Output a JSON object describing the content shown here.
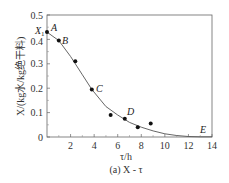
{
  "chart_data": {
    "type": "scatter",
    "title": "",
    "caption": "(a) X - τ",
    "xlabel": "τ/h",
    "ylabel": "X/(kg水/kg绝干料)",
    "xlim": [
      0,
      14
    ],
    "ylim": [
      0,
      0.5
    ],
    "xticks": [
      2,
      4,
      6,
      8,
      10,
      12,
      14
    ],
    "yticks": [
      0,
      0.1,
      0.2,
      0.3,
      0.4,
      0.5
    ],
    "ytick_labels": [
      "0",
      "0.1",
      "0.2",
      "0.3",
      "0.4",
      "0.5"
    ],
    "grid": false,
    "series": [
      {
        "name": "measured points",
        "x": [
          0,
          1.0,
          2.4,
          3.8,
          5.4,
          6.6,
          7.7,
          8.8
        ],
        "y": [
          0.43,
          0.395,
          0.31,
          0.195,
          0.09,
          0.075,
          0.04,
          0.055
        ]
      },
      {
        "name": "fitted curve",
        "x": [
          0,
          1.0,
          2.0,
          3.0,
          3.8,
          5.0,
          6.0,
          7.0,
          8.0,
          9.0,
          10.0,
          11.0,
          12.0,
          13.0,
          14.0
        ],
        "y": [
          0.43,
          0.395,
          0.33,
          0.255,
          0.195,
          0.125,
          0.09,
          0.06,
          0.04,
          0.025,
          0.013,
          0.006,
          0.002,
          0.001,
          0.001
        ]
      }
    ],
    "annotations": [
      {
        "label": "A",
        "x": 0,
        "y": 0.43
      },
      {
        "label": "B",
        "x": 1.0,
        "y": 0.395
      },
      {
        "label": "C",
        "x": 3.8,
        "y": 0.195
      },
      {
        "label": "D",
        "x": 6.6,
        "y": 0.075
      },
      {
        "label": "E",
        "x": 13.0,
        "y": 0.005
      },
      {
        "label": "X₁",
        "x": 0,
        "y": 0.43
      }
    ]
  },
  "labels": {
    "x_axis_title": "τ/h",
    "caption": "(a) X - τ",
    "y_axis_title": "X/(kg水/kg绝干料)",
    "x1": "X",
    "x1_sub": "1",
    "A": "A",
    "B": "B",
    "C": "C",
    "D": "D",
    "E": "E"
  }
}
